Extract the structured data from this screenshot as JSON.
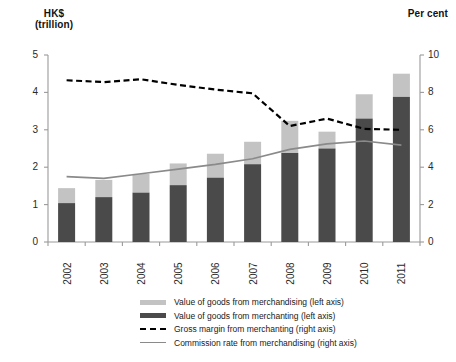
{
  "chart_data": {
    "type": "bar",
    "title": "",
    "subtitle": "",
    "categories": [
      "2002",
      "2003",
      "2004",
      "2005",
      "2006",
      "2007",
      "2008",
      "2009",
      "2010",
      "2011"
    ],
    "xlabel": "",
    "ylabel": "HK$ (trillion)",
    "y2label": "Per cent",
    "ylim": [
      0,
      5
    ],
    "y2lim": [
      0,
      10
    ],
    "yticks": [
      "0",
      "1",
      "2",
      "3",
      "4",
      "5"
    ],
    "y2ticks": [
      "0",
      "2",
      "4",
      "6",
      "8",
      "10"
    ],
    "grid": false,
    "legend_position": "bottom",
    "stacked": true,
    "series": [
      {
        "name": "Value of goods from merchanting (left axis)",
        "axis": "left",
        "type": "bar-segment",
        "color": "#4a4a4a",
        "values": [
          1.04,
          1.2,
          1.32,
          1.52,
          1.72,
          2.08,
          2.38,
          2.5,
          3.3,
          3.88
        ]
      },
      {
        "name": "Value of goods from merchandising (left axis)",
        "axis": "left",
        "type": "bar-segment",
        "color": "#c3c3c3",
        "values": [
          0.4,
          0.46,
          0.5,
          0.58,
          0.64,
          0.6,
          0.86,
          0.45,
          0.65,
          0.62
        ]
      },
      {
        "name": "Gross margin from merchanting (right axis)",
        "axis": "right",
        "type": "dashed-line",
        "color": "#000000",
        "values": [
          8.65,
          8.55,
          8.7,
          8.4,
          8.15,
          7.95,
          6.2,
          6.6,
          6.05,
          6.0
        ]
      },
      {
        "name": "Commission rate from merchandising (right axis)",
        "axis": "right",
        "type": "line",
        "color": "#8a8a8a",
        "values": [
          3.5,
          3.4,
          3.65,
          3.9,
          4.15,
          4.45,
          4.95,
          5.25,
          5.4,
          5.18
        ]
      }
    ],
    "totals": [
      1.44,
      1.66,
      1.82,
      2.1,
      2.36,
      2.68,
      3.24,
      2.95,
      3.95,
      4.5
    ]
  },
  "axes": {
    "left_title_line1": "HK$",
    "left_title_line2": "(trillion)",
    "right_title": "Per cent"
  },
  "legend": {
    "items": [
      {
        "label": "Value of goods from merchandising (left axis)",
        "swatch": "bar-light",
        "color": "#c3c3c3"
      },
      {
        "label": "Value of goods from merchanting (left axis)",
        "swatch": "bar-dark",
        "color": "#4a4a4a"
      },
      {
        "label": "Gross margin from merchanting (right axis)",
        "swatch": "dashed-line",
        "color": "#000000"
      },
      {
        "label": "Commission rate from merchandising (right axis)",
        "swatch": "solid-line",
        "color": "#8a8a8a"
      }
    ]
  },
  "colors": {
    "bar_dark": "#4a4a4a",
    "bar_light": "#c3c3c3",
    "dashed_line": "#000000",
    "solid_line": "#8a8a8a",
    "axis": "#9a9a9a",
    "text": "#1a1a1a",
    "background": "#ffffff"
  }
}
